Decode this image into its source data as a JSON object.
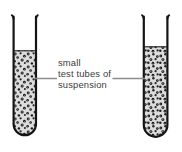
{
  "figure": {
    "kind": "science-diagram",
    "background_color": "#ffffff"
  },
  "callout": {
    "lines": [
      "small",
      "test tubes of",
      "suspension"
    ],
    "line1": "small",
    "line2": "test tubes of",
    "line3": "suspension",
    "text_color": "#3c3c3c",
    "leader_color": "#8c8c8c"
  },
  "tubes": [
    {
      "id": "left-test-tube",
      "label": "left test tube",
      "contents": "suspension",
      "glass_color": "#1a1a1a",
      "liquid_color": "#dcdcdc",
      "particle_color": "#1a1a1a",
      "fill_level_percent": 72
    },
    {
      "id": "right-test-tube",
      "label": "right test tube",
      "contents": "suspension",
      "glass_color": "#1a1a1a",
      "liquid_color": "#dcdcdc",
      "particle_color": "#1a1a1a",
      "fill_level_percent": 76
    }
  ]
}
